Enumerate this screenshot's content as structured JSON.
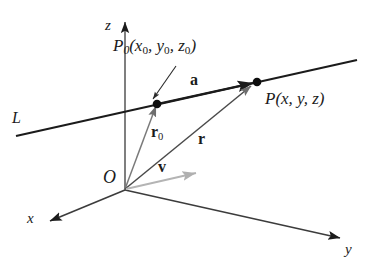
{
  "figure": {
    "background_color": "#ffffff",
    "ink_color": "#1b1b1b",
    "accent_color": "#a8a8a8"
  },
  "axes": {
    "z": {
      "label": "z",
      "direction": "up"
    },
    "x": {
      "label": "x",
      "direction": "down-left"
    },
    "y": {
      "label": "y",
      "direction": "down-right"
    }
  },
  "origin": {
    "label": "O"
  },
  "line": {
    "label": "L"
  },
  "points": {
    "p0": {
      "name": "P",
      "subscript": "0",
      "coords_open": "(",
      "x": "x",
      "x_sub": "0",
      "comma1": ", ",
      "y": "y",
      "y_sub": "0",
      "comma2": ", ",
      "z": "z",
      "z_sub": "0",
      "coords_close": ")",
      "full_label": "P0(x0, y0, z0)"
    },
    "p": {
      "name": "P",
      "coords_open": "(",
      "x": "x",
      "comma1": ", ",
      "y": "y",
      "comma2": ", ",
      "z": "z",
      "coords_close": ")",
      "full_label": "P(x, y, z)"
    }
  },
  "vectors": {
    "a": {
      "label": "a",
      "color": "#1b1b1b",
      "description": "vector from P0 to P along line L"
    },
    "r0": {
      "label": "r",
      "subscript": "0",
      "color": "#777777",
      "description": "position vector from O to P0"
    },
    "r": {
      "label": "r",
      "color": "#3a3a3a",
      "description": "position vector from O to P"
    },
    "v": {
      "label": "v",
      "color": "#b0b0b0",
      "description": "direction vector of line L"
    }
  }
}
